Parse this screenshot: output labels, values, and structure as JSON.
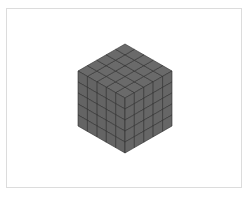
{
  "figure": {
    "grid_size": 5,
    "colors": {
      "background": "#ffffff",
      "frame": "#dcdcdc",
      "face_top": "#6a6a6a",
      "face_left": "#646464",
      "face_right": "#666666",
      "edge": "#2e2e2e"
    }
  }
}
